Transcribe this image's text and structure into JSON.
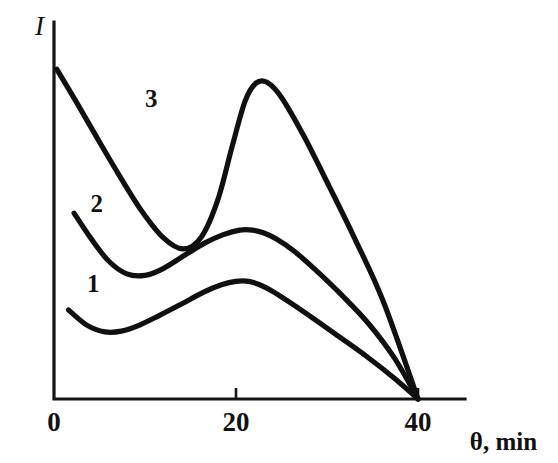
{
  "figure": {
    "background_color": "#ffffff",
    "ink_color": "#101010",
    "width": 558,
    "height": 463
  },
  "chart_data": {
    "type": "line",
    "title": "",
    "subtitle": "",
    "xlabel": "θ, min",
    "ylabel": "I",
    "xlim": [
      0,
      43.5
    ],
    "ylim": [
      0,
      1.0
    ],
    "xticks": [
      0,
      20,
      40
    ],
    "xticklabels": [
      "0",
      "20",
      "40"
    ],
    "yticks": [],
    "yticklabels": [],
    "grid": false,
    "legend": "inline-curve-labels",
    "axes_style": "open-L-frame",
    "annotations": [
      {
        "name": "curve-label-1",
        "text": "1",
        "x": 4.3,
        "y": 0.285
      },
      {
        "name": "curve-label-2",
        "text": "2",
        "x": 4.7,
        "y": 0.495
      },
      {
        "name": "curve-label-3",
        "text": "3",
        "x": 10.7,
        "y": 0.775
      },
      {
        "name": "y-axis-title",
        "text": "I",
        "x": -1.6,
        "y": 0.965
      },
      {
        "name": "x-axis-title",
        "text": "θ, min",
        "x": 45.7,
        "y": -0.06
      }
    ],
    "series": [
      {
        "name": "1",
        "label": "1",
        "x": [
          1.6,
          3.6,
          5.6,
          7.4,
          9.4,
          11.6,
          14.0,
          16.4,
          18.4,
          20.0,
          21.4,
          22.6,
          24.0,
          26.0,
          28.6,
          31.4,
          34.4,
          37.4,
          40.0
        ],
        "y": [
          0.236,
          0.196,
          0.178,
          0.18,
          0.196,
          0.222,
          0.252,
          0.283,
          0.303,
          0.312,
          0.312,
          0.303,
          0.286,
          0.255,
          0.212,
          0.164,
          0.112,
          0.055,
          0.0
        ]
      },
      {
        "name": "2",
        "label": "2",
        "x": [
          2.2,
          4.0,
          6.0,
          8.0,
          10.0,
          12.0,
          14.4,
          16.6,
          18.6,
          20.4,
          21.8,
          23.0,
          24.4,
          26.4,
          28.8,
          31.6,
          34.6,
          37.4,
          40.0
        ],
        "y": [
          0.493,
          0.428,
          0.366,
          0.332,
          0.328,
          0.346,
          0.382,
          0.414,
          0.436,
          0.448,
          0.448,
          0.441,
          0.425,
          0.392,
          0.341,
          0.276,
          0.199,
          0.109,
          0.0
        ]
      },
      {
        "name": "3",
        "label": "3",
        "x": [
          0.3,
          2.4,
          4.8,
          7.2,
          9.6,
          12.0,
          14.2,
          16.2,
          18.0,
          19.6,
          21.0,
          22.2,
          23.4,
          25.0,
          27.4,
          30.2,
          33.0,
          36.2,
          40.0
        ],
        "y": [
          0.875,
          0.79,
          0.69,
          0.592,
          0.5,
          0.428,
          0.398,
          0.43,
          0.528,
          0.672,
          0.79,
          0.838,
          0.84,
          0.8,
          0.7,
          0.566,
          0.428,
          0.258,
          0.0
        ]
      }
    ]
  }
}
